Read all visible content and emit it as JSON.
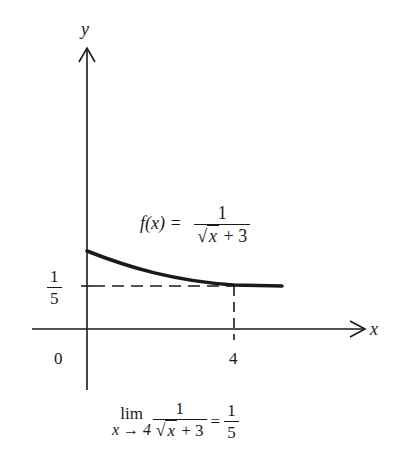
{
  "axes": {
    "x_label": "x",
    "y_label": "y",
    "origin_label": "0",
    "x_tick_label": "4",
    "y_tick_num": "1",
    "y_tick_den": "5"
  },
  "function_label": {
    "lhs": "f(x) =",
    "num": "1",
    "den_rad": "x",
    "den_rest": "+ 3"
  },
  "limit": {
    "lim": "lim",
    "sub": "x → 4",
    "num": "1",
    "den_rad": "x",
    "den_rest": "+ 3",
    "eq": "=",
    "res_num": "1",
    "res_den": "5"
  },
  "colors": {
    "ink": "#1a1a1a",
    "background": "#ffffff"
  }
}
